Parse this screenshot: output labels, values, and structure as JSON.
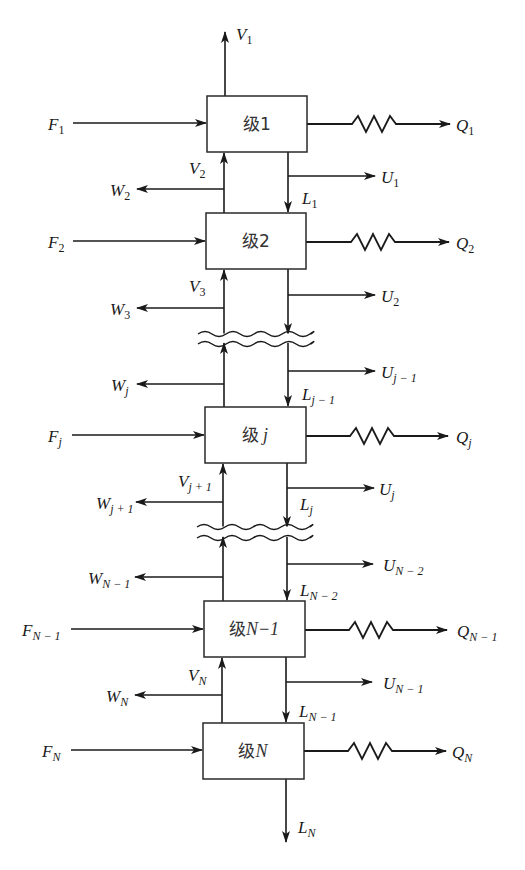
{
  "figure": {
    "title": "",
    "stage_prefix": "级",
    "stages": [
      {
        "id": "1",
        "box_label_var": "1",
        "var_italic": false,
        "box": {
          "x": 207,
          "y": 96,
          "w": 100,
          "h": 56
        },
        "feed": {
          "sym": "F",
          "sub": "1",
          "y": 123
        },
        "heat": {
          "sym": "Q",
          "sub": "1",
          "y": 124
        },
        "vapor_top": {
          "sym": "V",
          "sub": "1"
        },
        "vapor_in": {
          "sym": "V",
          "sub": "2",
          "y": 168
        },
        "side_vapor": {
          "sym": "W",
          "sub": "2",
          "y": 189
        },
        "side_liquid": {
          "sym": "U",
          "sub": "1",
          "y": 176
        },
        "liquid_out": {
          "sym": "L",
          "sub": "1",
          "y": 200
        }
      },
      {
        "id": "2",
        "box_label_var": "2",
        "var_italic": false,
        "box": {
          "x": 206,
          "y": 213,
          "w": 100,
          "h": 56
        },
        "feed": {
          "sym": "F",
          "sub": "2",
          "y": 241
        },
        "heat": {
          "sym": "Q",
          "sub": "2",
          "y": 242
        },
        "vapor_in": {
          "sym": "V",
          "sub": "3",
          "y": 287
        },
        "side_vapor": {
          "sym": "W",
          "sub": "3",
          "y": 308
        },
        "side_liquid": {
          "sym": "U",
          "sub": "2",
          "y": 295
        }
      },
      {
        "id": "j",
        "box_label_var": "j",
        "var_italic": true,
        "box": {
          "x": 205,
          "y": 407,
          "w": 101,
          "h": 56
        },
        "feed": {
          "sym": "F",
          "sub": "j",
          "y": 435
        },
        "heat": {
          "sym": "Q",
          "sub": "j",
          "y": 436
        },
        "side_vapor_above": {
          "sym": "W",
          "sub": "j",
          "y": 384
        },
        "side_liquid_above": {
          "sym": "U",
          "sub": "j − 1",
          "y": 371
        },
        "liquid_in": {
          "sym": "L",
          "sub": "j − 1",
          "y": 396
        },
        "vapor_in": {
          "sym": "V",
          "sub": "j + 1",
          "y": 482
        },
        "side_vapor": {
          "sym": "W",
          "sub": "j + 1",
          "y": 502
        },
        "side_liquid": {
          "sym": "U",
          "sub": "j",
          "y": 488
        },
        "liquid_out": {
          "sym": "L",
          "sub": "j",
          "y": 505
        }
      },
      {
        "id": "N-1",
        "box_label_var": "N−1",
        "var_italic": true,
        "box": {
          "x": 204,
          "y": 601,
          "w": 101,
          "h": 56
        },
        "feed": {
          "sym": "F",
          "sub": "N − 1",
          "y": 629
        },
        "heat": {
          "sym": "Q",
          "sub": "N − 1",
          "y": 630
        },
        "side_vapor_above": {
          "sym": "W",
          "sub": "N − 1",
          "y": 577
        },
        "side_liquid_above": {
          "sym": "U",
          "sub": "N − 2",
          "y": 564
        },
        "liquid_in": {
          "sym": "L",
          "sub": "N − 2",
          "y": 590
        },
        "vapor_in": {
          "sym": "V",
          "sub": "N",
          "y": 676
        },
        "side_vapor": {
          "sym": "W",
          "sub": "N",
          "y": 695
        },
        "side_liquid": {
          "sym": "U",
          "sub": "N − 1",
          "y": 682
        },
        "liquid_out": {
          "sym": "L",
          "sub": "N − 1",
          "y": 712
        }
      },
      {
        "id": "N",
        "box_label_var": "N",
        "var_italic": true,
        "box": {
          "x": 203,
          "y": 723,
          "w": 101,
          "h": 56
        },
        "feed": {
          "sym": "F",
          "sub": "N",
          "y": 750
        },
        "heat": {
          "sym": "Q",
          "sub": "N",
          "y": 751
        },
        "bottom": {
          "sym": "L",
          "sub": "N"
        }
      }
    ],
    "breaks": [
      {
        "y1": 333,
        "y2": 343
      },
      {
        "y1": 526,
        "y2": 537
      }
    ],
    "columns": {
      "vapor_x": 224,
      "liquid_x": 288
    },
    "colors": {
      "stroke": "#1a1a1a",
      "background": "#ffffff",
      "box_text": "#333333"
    }
  }
}
